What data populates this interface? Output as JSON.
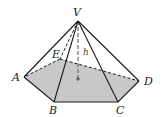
{
  "diagram": {
    "base_fill": "#c8c8c8",
    "edge_color": "#1a1a1a",
    "hidden_edge_style": "dashed",
    "vertices": {
      "V": {
        "label": "V",
        "x": 78,
        "y": 21
      },
      "A": {
        "label": "A",
        "x": 24,
        "y": 77
      },
      "B": {
        "label": "B",
        "x": 54,
        "y": 102
      },
      "C": {
        "label": "C",
        "x": 118,
        "y": 102
      },
      "D": {
        "label": "D",
        "x": 139,
        "y": 81
      },
      "E": {
        "label": "E",
        "x": 60,
        "y": 59
      }
    },
    "height_label": "h",
    "center_dot": {
      "x": 78,
      "y": 79
    }
  }
}
